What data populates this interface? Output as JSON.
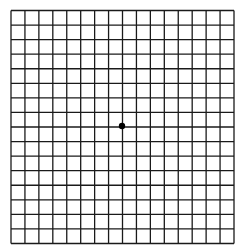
{
  "grid": {
    "name": "Amsler grid",
    "columns": 16,
    "rows": 16,
    "left": 11,
    "top": 10.5,
    "width": 223,
    "height": 233,
    "line_color": "#1a1a1a",
    "line_width": 1.3,
    "background": "#ffffff"
  },
  "center_dot": {
    "cx": 122,
    "cy": 126,
    "r": 3.2,
    "color": "#000000"
  }
}
